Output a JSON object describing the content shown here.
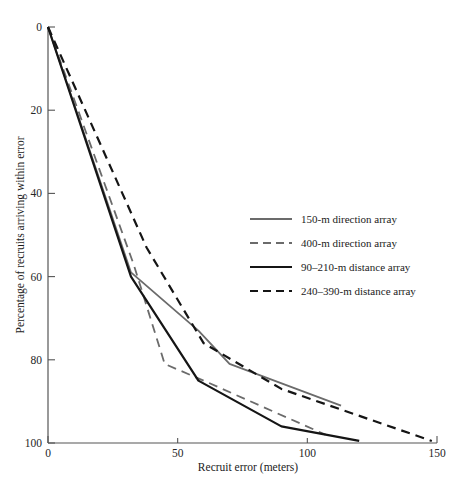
{
  "chart_data": {
    "type": "line",
    "title": "",
    "xlabel": "Recruit error (meters)",
    "ylabel": "Percentage of recruits arriving within error",
    "xlim": [
      0,
      150
    ],
    "ylim": [
      0,
      100
    ],
    "y_inverted": true,
    "grid": false,
    "xticks": [
      "0",
      "50",
      "100",
      "150"
    ],
    "xtick_values": [
      0,
      50,
      100,
      150
    ],
    "yticks": [
      "0",
      "20",
      "40",
      "60",
      "80",
      "100"
    ],
    "ytick_values": [
      0,
      20,
      40,
      60,
      80,
      100
    ],
    "legend_position": "center-right",
    "series": [
      {
        "name": "150-m direction array",
        "style": "solid",
        "color": "#6b6b6b",
        "width": 1.8,
        "x": [
          0,
          32,
          58,
          70,
          113
        ],
        "values": [
          0,
          59,
          73,
          81,
          91
        ]
      },
      {
        "name": "400-m direction array",
        "style": "dashed",
        "color": "#6b6b6b",
        "width": 1.8,
        "x": [
          0,
          33,
          45,
          60,
          107
        ],
        "values": [
          0,
          57,
          81,
          85,
          98
        ]
      },
      {
        "name": "90–210-m distance array",
        "style": "solid",
        "color": "#151515",
        "width": 2.2,
        "x": [
          0,
          32,
          58,
          90,
          120
        ],
        "values": [
          0,
          60,
          85,
          96,
          99.5
        ]
      },
      {
        "name": "240–390-m distance array",
        "style": "dashed",
        "color": "#151515",
        "width": 2.2,
        "x": [
          0,
          38,
          60,
          90,
          148
        ],
        "values": [
          0,
          53,
          76,
          87,
          99.5
        ]
      }
    ]
  },
  "legend": {
    "entries": [
      {
        "label": "150-m direction array"
      },
      {
        "label": "400-m direction array"
      },
      {
        "label": "90–210-m distance array"
      },
      {
        "label": "240–390-m distance array"
      }
    ]
  },
  "axes": {
    "x_label": "Recruit error (meters)",
    "y_label": "Percentage of recruits arriving within error",
    "x_ticks": [
      "0",
      "50",
      "100",
      "150"
    ],
    "y_ticks": [
      "0",
      "20",
      "40",
      "60",
      "80",
      "100"
    ]
  }
}
